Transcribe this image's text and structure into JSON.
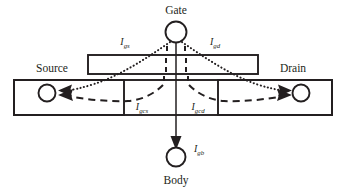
{
  "figure": {
    "type": "diagram",
    "background_color": "#ffffff",
    "ink_color": "#231f20",
    "width": 346,
    "height": 193
  },
  "terminals": [
    {
      "id": "gate",
      "label": "Gate",
      "cx": 176,
      "cy": 32,
      "r": 10.5,
      "label_x": 176,
      "label_y": 14
    },
    {
      "id": "source",
      "label": "Source",
      "cx": 47,
      "cy": 93,
      "r": 8.5,
      "label_x": 52,
      "label_y": 72
    },
    {
      "id": "drain",
      "label": "Drain",
      "cx": 301,
      "cy": 93,
      "r": 8.5,
      "label_x": 293,
      "label_y": 72
    },
    {
      "id": "body",
      "label": "Body",
      "cx": 176,
      "cy": 157,
      "r": 9.5,
      "label_x": 176,
      "label_y": 184
    }
  ],
  "currents": [
    {
      "id": "Igs",
      "symbol": "I",
      "subscript": "gs",
      "x": 125,
      "y": 45,
      "style": "dotted",
      "description": "gate-to-source tunneling current"
    },
    {
      "id": "Igd",
      "symbol": "I",
      "subscript": "gd",
      "x": 215,
      "y": 45,
      "style": "dotted",
      "description": "gate-to-drain tunneling current"
    },
    {
      "id": "Igcs",
      "symbol": "I",
      "subscript": "gcs",
      "x": 142,
      "y": 110,
      "style": "dashed",
      "description": "gate-to-channel current collected at source"
    },
    {
      "id": "Igcd",
      "symbol": "I",
      "subscript": "gcd",
      "x": 198,
      "y": 110,
      "style": "dashed",
      "description": "gate-to-channel current collected at drain"
    },
    {
      "id": "Igb",
      "symbol": "I",
      "subscript": "gb",
      "x": 199,
      "y": 152,
      "style": "solid",
      "description": "gate-to-body current"
    }
  ],
  "shapes": {
    "gate_plate": {
      "x": 88,
      "y": 55,
      "width": 170,
      "height": 19
    },
    "substrate_box": {
      "x": 14,
      "y": 80,
      "width": 318,
      "height": 35
    },
    "source_box": {
      "x": 14,
      "y": 80,
      "width": 110,
      "height": 35
    },
    "drain_box": {
      "x": 218,
      "y": 80,
      "width": 114,
      "height": 35
    }
  }
}
